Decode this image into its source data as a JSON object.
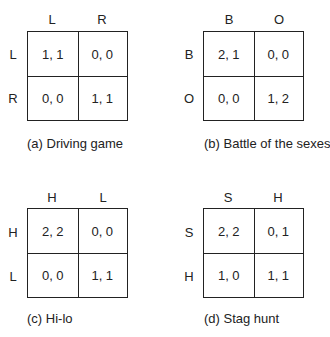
{
  "games": [
    {
      "caption": "(a) Driving game",
      "columns": [
        "L",
        "R"
      ],
      "rows": [
        "L",
        "R"
      ],
      "payoffs": [
        [
          "1, 1",
          "0, 0"
        ],
        [
          "0, 0",
          "1, 1"
        ]
      ]
    },
    {
      "caption": "(b) Battle of the sexes",
      "columns": [
        "B",
        "O"
      ],
      "rows": [
        "B",
        "O"
      ],
      "payoffs": [
        [
          "2, 1",
          "0, 0"
        ],
        [
          "0, 0",
          "1, 2"
        ]
      ]
    },
    {
      "caption": "(c) Hi-lo",
      "columns": [
        "H",
        "L"
      ],
      "rows": [
        "H",
        "L"
      ],
      "payoffs": [
        [
          "2, 2",
          "0, 0"
        ],
        [
          "0, 0",
          "1, 1"
        ]
      ]
    },
    {
      "caption": "(d) Stag hunt",
      "columns": [
        "S",
        "H"
      ],
      "rows": [
        "S",
        "H"
      ],
      "payoffs": [
        [
          "2, 2",
          "0, 1"
        ],
        [
          "1, 0",
          "1, 1"
        ]
      ]
    }
  ]
}
